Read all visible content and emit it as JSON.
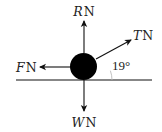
{
  "diagram": {
    "type": "free-body-diagram",
    "forces": {
      "reaction": {
        "symbol": "R",
        "unit": "N",
        "direction": "up"
      },
      "tension": {
        "symbol": "T",
        "unit": "N",
        "direction": "up-right",
        "angle_deg": 19
      },
      "friction": {
        "symbol": "F",
        "unit": "N",
        "direction": "left"
      },
      "weight": {
        "symbol": "W",
        "unit": "N",
        "direction": "down"
      }
    },
    "angle_label": "19°",
    "colors": {
      "ink": "#111111",
      "body": "#000000",
      "arc": "#bbbbbb"
    }
  }
}
